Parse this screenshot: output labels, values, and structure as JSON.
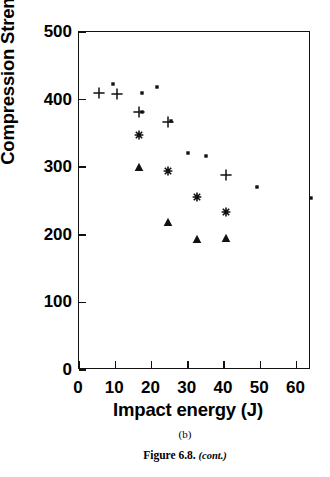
{
  "figure": {
    "panel_label": "(b)",
    "caption_main": "Figure 6.8.",
    "caption_cont": "(cont.)"
  },
  "chart_data": {
    "type": "scatter",
    "title": "",
    "xlabel": "Impact energy (J)",
    "ylabel": "Compression Strength (MPa)",
    "xlim": [
      0,
      64
    ],
    "ylim": [
      0,
      500
    ],
    "xticks": [
      0,
      10,
      20,
      30,
      40,
      50,
      60
    ],
    "yticks": [
      0,
      100,
      200,
      300,
      400,
      500
    ],
    "xtick_labels": [
      "0",
      "10",
      "20",
      "30",
      "40",
      "50",
      "60"
    ],
    "ytick_labels": [
      "0",
      "100",
      "200",
      "300",
      "400",
      "500"
    ],
    "grid": false,
    "legend": false,
    "legend_position": "none",
    "series": [
      {
        "name": "dot",
        "marker": "dot",
        "points": [
          {
            "x": 9.5,
            "y": 423
          },
          {
            "x": 17.5,
            "y": 410
          },
          {
            "x": 21.5,
            "y": 419
          },
          {
            "x": 17.5,
            "y": 382
          },
          {
            "x": 25.5,
            "y": 368
          },
          {
            "x": 30.0,
            "y": 321
          },
          {
            "x": 35.0,
            "y": 316
          },
          {
            "x": 49.0,
            "y": 271
          },
          {
            "x": 64.0,
            "y": 255
          }
        ]
      },
      {
        "name": "plus",
        "marker": "plus",
        "points": [
          {
            "x": 5.5,
            "y": 410
          },
          {
            "x": 10.5,
            "y": 408
          },
          {
            "x": 16.5,
            "y": 382
          },
          {
            "x": 24.5,
            "y": 367
          },
          {
            "x": 40.5,
            "y": 288
          }
        ]
      },
      {
        "name": "star",
        "marker": "star",
        "points": [
          {
            "x": 16.5,
            "y": 348
          },
          {
            "x": 24.5,
            "y": 294
          },
          {
            "x": 32.5,
            "y": 256
          },
          {
            "x": 40.5,
            "y": 233
          }
        ]
      },
      {
        "name": "triangle",
        "marker": "triangle",
        "points": [
          {
            "x": 16.5,
            "y": 300
          },
          {
            "x": 24.5,
            "y": 219
          },
          {
            "x": 32.5,
            "y": 194
          },
          {
            "x": 40.5,
            "y": 195
          }
        ]
      }
    ]
  }
}
